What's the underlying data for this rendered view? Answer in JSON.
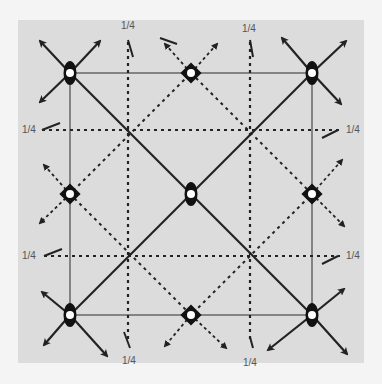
{
  "diagram": {
    "type": "symmetry-diagram",
    "colors": {
      "background": "#f4f4f4",
      "panel": "#dcdcdc",
      "line": "#222222",
      "thin_line": "#555555",
      "label": "#555555"
    },
    "square": {
      "corners": [
        [
          70,
          73
        ],
        [
          312,
          73
        ],
        [
          312,
          315
        ],
        [
          70,
          315
        ]
      ],
      "center": [
        191,
        194
      ]
    },
    "quarter_lines": {
      "verticals_x": [
        130,
        251
      ],
      "horizontals_y": [
        130,
        256
      ]
    },
    "symbols": [
      {
        "kind": "two-fold-axis-with-inversion",
        "pos": [
          70,
          73
        ]
      },
      {
        "kind": "two-fold-axis-with-inversion",
        "pos": [
          312,
          73
        ]
      },
      {
        "kind": "two-fold-axis-with-inversion",
        "pos": [
          70,
          315
        ]
      },
      {
        "kind": "two-fold-axis-with-inversion",
        "pos": [
          312,
          315
        ]
      },
      {
        "kind": "two-fold-axis-with-inversion",
        "pos": [
          191,
          194
        ]
      },
      {
        "kind": "four-bar-axis",
        "pos": [
          191,
          73
        ]
      },
      {
        "kind": "four-bar-axis",
        "pos": [
          191,
          315
        ]
      },
      {
        "kind": "four-bar-axis",
        "pos": [
          70,
          194
        ]
      },
      {
        "kind": "four-bar-axis",
        "pos": [
          312,
          194
        ]
      }
    ],
    "labels": {
      "top_left": "1/4",
      "top_right": "1/4",
      "bottom_left": "1/4",
      "bottom_right": "1/4",
      "left_upper": "1/4",
      "left_lower": "1/4",
      "right_upper": "1/4",
      "right_lower": "1/4"
    }
  }
}
